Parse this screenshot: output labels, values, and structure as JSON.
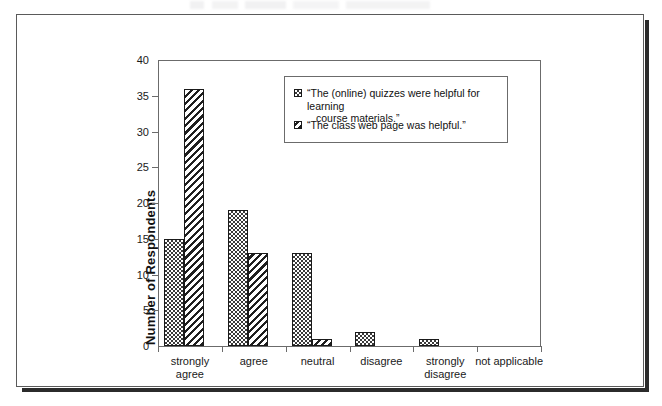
{
  "chart_data": {
    "type": "bar",
    "title": "",
    "xlabel": "",
    "ylabel": "Number of Respondents",
    "ylim": [
      0,
      40
    ],
    "ystep": 5,
    "yticks": [
      "40",
      "35",
      "30",
      "25",
      "20",
      "15",
      "10",
      "5",
      "0"
    ],
    "grid": false,
    "legend_position": "inside-top-right",
    "categories": [
      "strongly\nagree",
      "agree",
      "neutral",
      "disagree",
      "strongly\ndisagree",
      "not applicable"
    ],
    "category_labels": [
      {
        "line1": "strongly",
        "line2": "agree"
      },
      {
        "line1": "agree",
        "line2": ""
      },
      {
        "line1": "neutral",
        "line2": ""
      },
      {
        "line1": "disagree",
        "line2": ""
      },
      {
        "line1": "strongly",
        "line2": "disagree"
      },
      {
        "line1": "not applicable",
        "line2": ""
      }
    ],
    "series": [
      {
        "name": "“The (online) quizzes were helpful for learning course materials.”",
        "pattern": "dotted",
        "values": [
          15,
          19,
          13,
          2,
          1,
          0
        ]
      },
      {
        "name": "“The class web page was helpful.”",
        "pattern": "diagonal-hatch",
        "values": [
          36,
          13,
          1,
          0,
          0,
          0
        ]
      }
    ]
  },
  "legend": {
    "items": [
      {
        "swatch": "dotted",
        "line1": "“The (online) quizzes were helpful for learning",
        "line2": "course materials.”"
      },
      {
        "swatch": "diagonal-hatch",
        "line1": "“The class web page was helpful.”",
        "line2": ""
      }
    ]
  },
  "colors": {
    "ink": "#1a1a1a",
    "axis": "#6b6b6b",
    "frame": "#5a5a5a",
    "shadow": "#2b2b2b",
    "background": "#ffffff"
  }
}
